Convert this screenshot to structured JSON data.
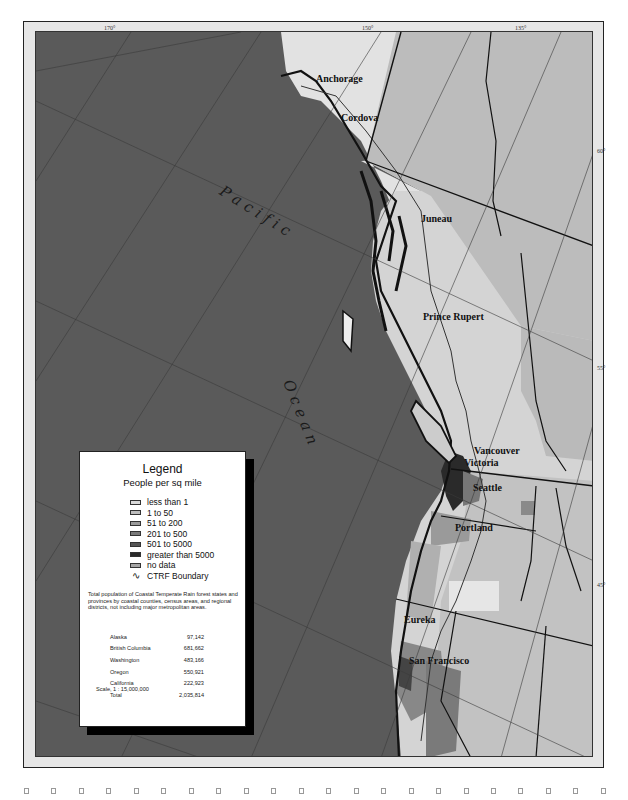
{
  "map": {
    "longitude_labels": [
      {
        "label": "170°",
        "x": 104,
        "y": 25
      },
      {
        "label": "150°",
        "x": 362,
        "y": 25
      },
      {
        "label": "135°",
        "x": 515,
        "y": 25
      }
    ],
    "latitude_labels": [
      {
        "label": "60°",
        "x": 597,
        "y": 148
      },
      {
        "label": "55°",
        "x": 597,
        "y": 365
      },
      {
        "label": "45°",
        "x": 597,
        "y": 582
      }
    ],
    "ocean_label": {
      "word1": "Pacific",
      "word2": "Ocean"
    },
    "cities": [
      {
        "name": "Anchorage",
        "x": 315,
        "y": 78
      },
      {
        "name": "Cordova",
        "x": 340,
        "y": 117
      },
      {
        "name": "Juneau",
        "x": 420,
        "y": 218
      },
      {
        "name": "Prince Rupert",
        "x": 422,
        "y": 316
      },
      {
        "name": "Vancouver",
        "x": 473,
        "y": 450
      },
      {
        "name": "Victoria",
        "x": 463,
        "y": 462
      },
      {
        "name": "Seattle",
        "x": 472,
        "y": 487
      },
      {
        "name": "Portland",
        "x": 454,
        "y": 527
      },
      {
        "name": "Eureka",
        "x": 403,
        "y": 619
      },
      {
        "name": "San Francisco",
        "x": 408,
        "y": 660
      }
    ],
    "colors": {
      "ocean": "#5a5a5a",
      "land_very_light": "#e4e4e4",
      "land_light": "#c8c8c8",
      "land_mid": "#a8a8a8",
      "land_dark": "#7a7a7a",
      "coast": "#111111"
    }
  },
  "legend": {
    "title": "Legend",
    "subtitle": "People per sq mile",
    "items": [
      {
        "label": "less than 1",
        "color": "#d9d9d9"
      },
      {
        "label": "1 to 50",
        "color": "#bdbdbd"
      },
      {
        "label": "51 to 200",
        "color": "#9a9a9a"
      },
      {
        "label": "201 to 500",
        "color": "#7a7a7a"
      },
      {
        "label": "501 to 5000",
        "color": "#555555"
      },
      {
        "label": "greater than 5000",
        "color": "#2a2a2a"
      },
      {
        "label": "no data",
        "color": "#a5a5a5"
      }
    ],
    "boundary_label": "CTRF Boundary",
    "boundary_glyph": "∿",
    "note": "Total population of Coastal Temperate Rain forest states and provinces by coastal counties, census areas, and regional districts, not including major metropolitan areas.",
    "population": [
      {
        "region": "Alaska",
        "value": "97,142"
      },
      {
        "region": "British Columbia",
        "value": "681,662"
      },
      {
        "region": "Washington",
        "value": "483,166"
      },
      {
        "region": "Oregon",
        "value": "550,921"
      },
      {
        "region": "California",
        "value": "222,923"
      },
      {
        "region": "Total",
        "value": "2,035,814"
      }
    ],
    "scale": "Scale, 1 : 15,000,000"
  },
  "binding_holes": {
    "count": 22
  }
}
